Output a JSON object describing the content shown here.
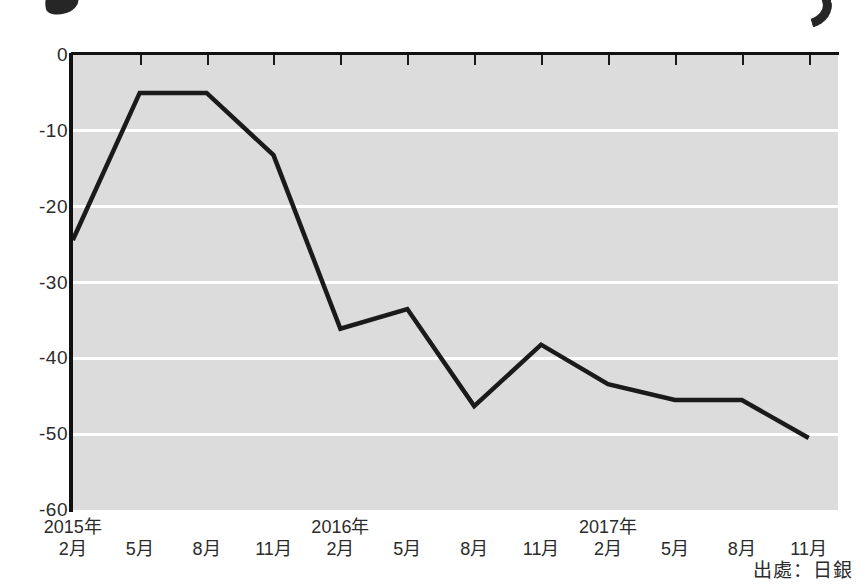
{
  "figure": {
    "source_note": "出處：日銀",
    "ink_marks": [
      "headline-stroke-left",
      "headline-stroke-right"
    ]
  },
  "chart_data": {
    "type": "line",
    "title": "",
    "subtitle": "",
    "xlabel": "",
    "ylabel": "",
    "grid": true,
    "legend": "none",
    "ylim": [
      -60,
      0
    ],
    "yticks": [
      0,
      -10,
      -20,
      -30,
      -40,
      -50,
      -60
    ],
    "ytick_labels": [
      "0",
      "-10",
      "-20",
      "-30",
      "-40",
      "-50",
      "-60"
    ],
    "xtick_labels": [
      {
        "year": "2015年",
        "month": "2月"
      },
      {
        "year": "",
        "month": "5月"
      },
      {
        "year": "",
        "month": "8月"
      },
      {
        "year": "",
        "month": "11月"
      },
      {
        "year": "2016年",
        "month": "2月"
      },
      {
        "year": "",
        "month": "5月"
      },
      {
        "year": "",
        "month": "8月"
      },
      {
        "year": "",
        "month": "11月"
      },
      {
        "year": "2017年",
        "month": "2月"
      },
      {
        "year": "",
        "month": "5月"
      },
      {
        "year": "",
        "month": "8月"
      },
      {
        "year": "",
        "month": "11月"
      }
    ],
    "categories": [
      "2015年2月",
      "2015年5月",
      "2015年8月",
      "2015年11月",
      "2016年2月",
      "2016年5月",
      "2016年8月",
      "2016年11月",
      "2017年2月",
      "2017年5月",
      "2017年8月",
      "2017年11月"
    ],
    "x": [
      0,
      1,
      2,
      3,
      4,
      5,
      6,
      7,
      8,
      9,
      10,
      11
    ],
    "values": [
      -24.4,
      -5.0,
      -5.0,
      -13.2,
      -36.1,
      -33.5,
      -46.3,
      -38.2,
      -43.4,
      -45.5,
      -45.5,
      -50.5
    ],
    "series": [
      {
        "name": "",
        "color": "#1a1a1a",
        "values": [
          -24.4,
          -5.0,
          -5.0,
          -13.2,
          -36.1,
          -33.5,
          -46.3,
          -38.2,
          -43.4,
          -45.5,
          -45.5,
          -50.5
        ]
      }
    ],
    "colors": {
      "plot_background": "#dcdcdc",
      "gridline": "#ffffff",
      "line": "#1a1a1a",
      "axis": "#111111",
      "text": "#2b2b2b",
      "page_background": "#ffffff"
    }
  }
}
